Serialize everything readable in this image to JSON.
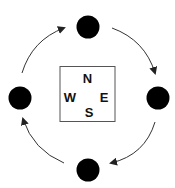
{
  "diagram": {
    "compass": {
      "north": "N",
      "south": "S",
      "east": "E",
      "west": "W"
    },
    "nodes": [
      {
        "id": "top",
        "position": "north"
      },
      {
        "id": "right",
        "position": "east"
      },
      {
        "id": "bottom",
        "position": "south"
      },
      {
        "id": "left",
        "position": "west"
      }
    ],
    "arrows": [
      {
        "from": "top",
        "to": "right"
      },
      {
        "from": "right",
        "to": "bottom"
      },
      {
        "from": "bottom",
        "to": "left"
      },
      {
        "from": "left",
        "to": "top"
      }
    ],
    "direction": "clockwise",
    "colors": {
      "node": "#000000",
      "line": "#333333",
      "box": "#555555"
    }
  }
}
